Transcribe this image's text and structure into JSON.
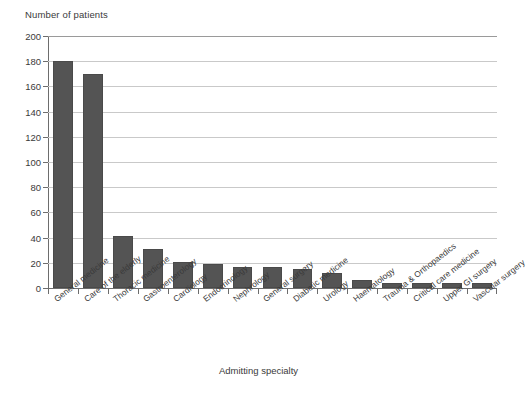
{
  "chart_data": {
    "type": "bar",
    "title": "",
    "ylabel": "Number of patients",
    "xlabel": "Admitting specialty",
    "ylim": [
      0,
      200
    ],
    "yticks": [
      0,
      20,
      40,
      60,
      80,
      100,
      120,
      140,
      160,
      180,
      200
    ],
    "grid": true,
    "legend": "none",
    "bar_color": "#545454",
    "grid_color": "#c9c9c9",
    "axis_color": "#6d6d6d",
    "categories": [
      "General medicine",
      "Care of the elderly",
      "Thoracic medicine",
      "Gastroenterology",
      "Cardiology",
      "Endocrinology",
      "Nephrology",
      "General surgery",
      "Diabetic medicine",
      "Urology",
      "Haematology",
      "Trauma & Orthopaedics",
      "Critical care medicine",
      "Upper GI surgery",
      "Vascular surgery"
    ],
    "values": [
      180,
      170,
      41,
      31,
      21,
      19,
      17,
      17,
      15,
      12,
      6,
      4,
      4,
      4,
      4
    ]
  },
  "axis": {
    "y_title": "Number of patients",
    "x_title": "Admitting specialty",
    "y_tick_labels": [
      "0",
      "20",
      "40",
      "60",
      "80",
      "100",
      "120",
      "140",
      "160",
      "180",
      "200"
    ]
  }
}
